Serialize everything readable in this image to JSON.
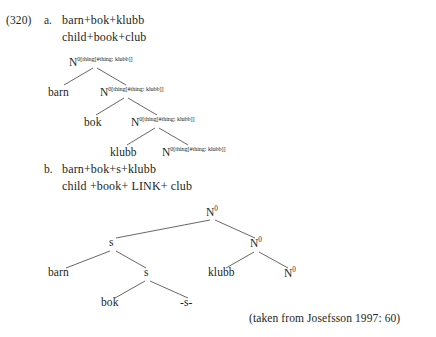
{
  "example": {
    "number": "(320)",
    "items": [
      {
        "label": "a.",
        "source_line": "barn+bok+klubb",
        "gloss_line": "child+book+club"
      },
      {
        "label": "b.",
        "source_line": "barn+bok+s+klubb",
        "gloss_line": "child +book+ LINK+ club"
      }
    ]
  },
  "tree_a": {
    "node_label_base": "N",
    "node_label_sup": "0[thing[#thing: klubb]]",
    "nodes": [
      {
        "id": "n1",
        "base": "N",
        "sup": "0[thing[#thing: klubb]]"
      },
      {
        "id": "n2",
        "base": "N",
        "sup": "0[thing[#thing: klubb]]"
      },
      {
        "id": "n3",
        "base": "N",
        "sup": "0[thing[#thing: klubb]]"
      },
      {
        "id": "n4",
        "base": "N",
        "sup": "0[thing[#thing: klubb]]"
      }
    ],
    "leaves": [
      {
        "id": "l1",
        "text": "barn"
      },
      {
        "id": "l2",
        "text": "bok"
      },
      {
        "id": "l3",
        "text": "klubb"
      }
    ]
  },
  "tree_b": {
    "nodes": [
      {
        "id": "root",
        "base": "N",
        "sup": "0"
      },
      {
        "id": "s_high",
        "text": "s"
      },
      {
        "id": "n_right",
        "base": "N",
        "sup": "0"
      },
      {
        "id": "s_low",
        "text": "s"
      },
      {
        "id": "n_far_right",
        "base": "N",
        "sup": "0"
      }
    ],
    "leaves": [
      {
        "id": "b1",
        "text": "barn"
      },
      {
        "id": "b2",
        "text": "klubb"
      },
      {
        "id": "b3",
        "text": "bok"
      },
      {
        "id": "b4",
        "text": "-s-"
      }
    ]
  },
  "citation": "(taken from Josefsson 1997: 60)"
}
